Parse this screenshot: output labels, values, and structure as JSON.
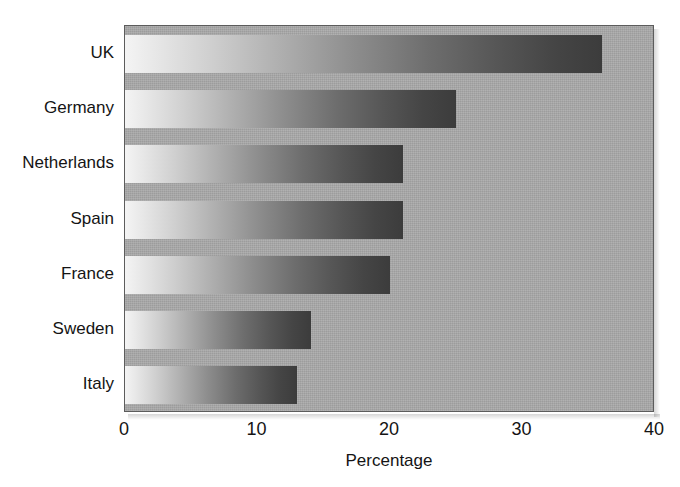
{
  "chart_data": {
    "type": "bar",
    "orientation": "horizontal",
    "title": "",
    "subtitle": "",
    "xlabel": "Percentage",
    "ylabel": "",
    "categories": [
      "UK",
      "Germany",
      "Netherlands",
      "Spain",
      "France",
      "Sweden",
      "Italy"
    ],
    "values": [
      36,
      25,
      21,
      21,
      20,
      14,
      13
    ],
    "xlim": [
      0,
      40
    ],
    "xticks": [
      0,
      10,
      20,
      30,
      40
    ],
    "xtick_labels": [
      "0",
      "10",
      "20",
      "30",
      "40"
    ],
    "grid": false,
    "legend": null,
    "legend_position": "none",
    "annotations": [],
    "series": [
      {
        "name": "Percentage",
        "values": [
          36,
          25,
          21,
          21,
          20,
          14,
          13
        ]
      }
    ]
  },
  "style": {
    "plot_background": "#a9a9a9",
    "page_background": "#ffffff",
    "axis_color": "#5c5c5c",
    "text_color": "#141414",
    "bar_gradient_start": "#f4f4f4",
    "bar_gradient_end": "#3c3c3c"
  }
}
